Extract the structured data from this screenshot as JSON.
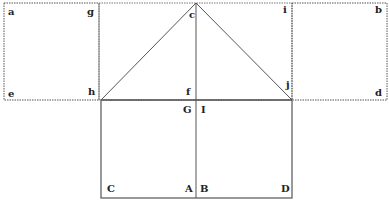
{
  "diagram": {
    "type": "geometric net",
    "line_color": "#444444",
    "labels": {
      "a": "a",
      "g": "g",
      "c": "c",
      "i": "i",
      "b": "b",
      "e": "e",
      "h": "h",
      "f": "f",
      "j": "j",
      "d": "d",
      "G": "G",
      "I": "I",
      "C": "C",
      "A": "A",
      "B": "B",
      "D": "D"
    }
  }
}
